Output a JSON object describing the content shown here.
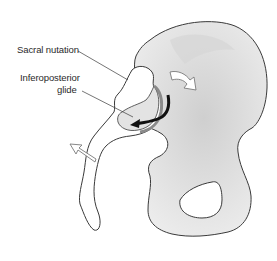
{
  "figure": {
    "labels": {
      "sacral_nutation": "Sacral nutation",
      "inferoposterior_glide_line1": "Inferoposterior",
      "inferoposterior_glide_line2": "glide"
    },
    "arrows": [
      {
        "name": "iliac-rotation-arrow",
        "style": "white-outline",
        "direction": "clockwise-down-right"
      },
      {
        "name": "glide-arrow",
        "style": "solid-black",
        "direction": "down-then-left"
      },
      {
        "name": "coccyx-arrow",
        "style": "white-outline",
        "direction": "up-left"
      }
    ],
    "colors": {
      "bone_fill": "#e6e6e6",
      "bone_shadow": "#c9c9c9",
      "outline": "#3a3a3a",
      "arrow_black": "#111111",
      "text": "#2a2a2a",
      "background": "#ffffff"
    }
  }
}
